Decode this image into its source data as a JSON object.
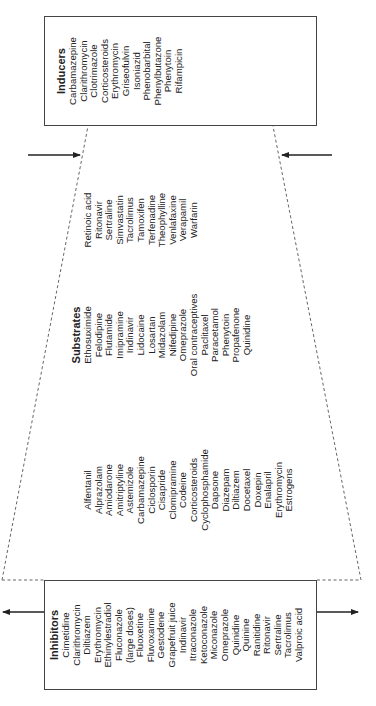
{
  "diagram": {
    "inhibitors": {
      "title": "Inhibitors",
      "items": [
        "Cimetidine",
        "Clarithromycin",
        "Diltiazem",
        "Erythromycin",
        "Ethinylestradiol",
        "Fluconazole",
        "(large doses)",
        "Fluoxetine",
        "Fluvoxamine",
        "Gestodene",
        "Grapefruit juice",
        "Indinavir",
        "Itraconazole",
        "Ketoconazole",
        "Miconazole",
        "Omeprazole",
        "Quinidine",
        "Quinine",
        "Ranitidine",
        "Ritonavir",
        "Sertraline",
        "Tacrolimus",
        "Valproic acid"
      ]
    },
    "substrates": {
      "title": "Substrates",
      "columns": [
        [
          "Alfentanil",
          "Alprazolam",
          "Amiodarone",
          "Amitriptyline",
          "Astemizole",
          "Carbamazepine",
          "Ciclosporin",
          "Cisapride",
          "Clomipramine",
          "Codeine",
          "Corticosteroids",
          "Cyclophosphamide",
          "Dapsone",
          "Diazepam",
          "Diltiazem",
          "Docetaxel",
          "Doxepin",
          "Enalapril",
          "Erythromycin",
          "Estrogens"
        ],
        [
          "Ethosuximide",
          "Felodipine",
          "Flutamide",
          "Imipramine",
          "Indinavir",
          "Lidocaine",
          "Losartan",
          "Midazolam",
          "Nifedipine",
          "Omeprazole",
          "Oral contraceptives",
          "Paclitaxel",
          "Paracetamol",
          "Phenytoin",
          "Propafenone",
          "Quinidine"
        ],
        [
          "Retinoic acid",
          "Ritonavir",
          "Sertraline",
          "Simvastatin",
          "Tacrolimus",
          "Tamoxifen",
          "Terfenadine",
          "Theophylline",
          "Venlafaxine",
          "Verapamil",
          "Warfarin"
        ]
      ]
    },
    "inducers": {
      "title": "Inducers",
      "items": [
        "Carbamazepine",
        "Clarithromycin",
        "Clotrimazole",
        "Corticosteroids",
        "Erythromycin",
        "Griseofulvin",
        "Isoniazid",
        "Phenobarbital",
        "Phenylbutazone",
        "Phenytoin",
        "Rifampicin"
      ]
    },
    "colors": {
      "line": "#333333",
      "dash": "#666666",
      "text": "#222222"
    }
  }
}
